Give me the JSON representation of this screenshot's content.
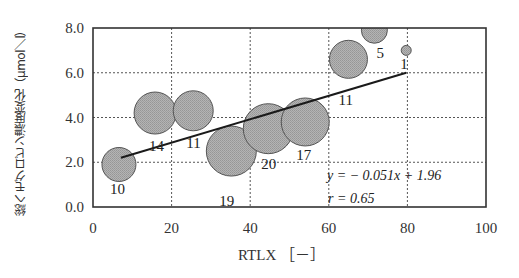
{
  "chart_data": {
    "type": "scatter",
    "subtype": "bubble",
    "title": "",
    "xlabel": "RTLX [－]",
    "ylabel": "総ヘモグロビン濃度変化（μmol／l）",
    "xlim": [
      0,
      100
    ],
    "ylim": [
      0.0,
      8.0
    ],
    "xticks": [
      "0",
      "20",
      "40",
      "60",
      "80",
      "100"
    ],
    "yticks": [
      "0.0",
      "2.0",
      "4.0",
      "6.0",
      "8.0"
    ],
    "grid": true,
    "legend": null,
    "points": [
      {
        "x": 6.6,
        "y": 1.9,
        "size": 17,
        "label": "10"
      },
      {
        "x": 15.8,
        "y": 4.2,
        "size": 21,
        "label": "14"
      },
      {
        "x": 25.5,
        "y": 4.3,
        "size": 20,
        "label": "11"
      },
      {
        "x": 35.2,
        "y": 2.5,
        "size": 25,
        "label": "19"
      },
      {
        "x": 44.6,
        "y": 3.5,
        "size": 25,
        "label": "20"
      },
      {
        "x": 54.0,
        "y": 3.8,
        "size": 24,
        "label": "17"
      },
      {
        "x": 65.0,
        "y": 6.6,
        "size": 19,
        "label": "11"
      },
      {
        "x": 71.6,
        "y": 7.9,
        "size": 13,
        "label": "5"
      },
      {
        "x": 79.7,
        "y": 7.0,
        "size": 5,
        "label": "1"
      }
    ],
    "regression": {
      "x_start": 7.1,
      "y_start": 2.2,
      "x_end": 79.7,
      "y_end": 6.0
    },
    "annotations": {
      "equation": "y = − 0.051x + 1.96",
      "r": "r = 0.65"
    },
    "colors": {
      "bubble_fill": "#a9a9a9",
      "bubble_stroke": "#555555",
      "axis": "#333333",
      "grid": "#555555",
      "line": "#1a1a1a"
    }
  },
  "labels": {
    "xlabel": "RTLX ［－］",
    "ylabel": "総ヘモグロビン濃度変化（μmol／l）",
    "equation": "y = − 0.051x + 1.96",
    "r": "r = 0.65"
  }
}
